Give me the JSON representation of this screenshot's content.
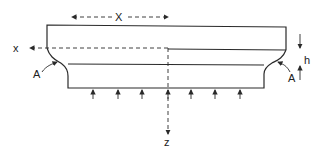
{
  "diagram": {
    "labels": {
      "dimension_X": "X",
      "axis_x": "x",
      "axis_z": "z",
      "fillet_left": "A",
      "fillet_right": "A",
      "height": "h"
    },
    "colors": {
      "stroke": "#2a2a2a",
      "background": "#ffffff"
    },
    "load_arrow_count": 7
  }
}
